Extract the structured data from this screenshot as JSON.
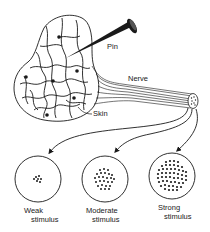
{
  "diagram": {
    "title": "",
    "labels": {
      "pin": "Pin",
      "nerve": "Nerve",
      "skin": "Skin"
    },
    "stimuli": [
      {
        "line1": "Weak",
        "line2": "stimulus",
        "intensity": "weak"
      },
      {
        "line1": "Moderate",
        "line2": "stimulus",
        "intensity": "moderate"
      },
      {
        "line1": "Strong",
        "line2": "stimulus",
        "intensity": "strong"
      }
    ],
    "colors": {
      "ink": "#1a1a1a",
      "background": "#ffffff"
    }
  }
}
